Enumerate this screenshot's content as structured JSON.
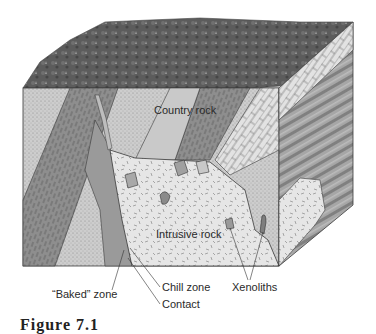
{
  "diagram": {
    "labels": {
      "country_rock": "Country rock",
      "intrusive_rock": "Intrusive rock",
      "baked_zone": "“Baked” zone",
      "chill_zone": "Chill zone",
      "contact": "Contact",
      "xenoliths": "Xenoliths"
    },
    "caption": "Figure 7.1",
    "colors": {
      "surface": "#5e5e5e",
      "country_light": "#cfcfcf",
      "country_dark": "#8c8c8c",
      "intrusive": "#e4e4e4",
      "limestone": "#dcdcdc",
      "outline": "#3a3a3a"
    }
  }
}
